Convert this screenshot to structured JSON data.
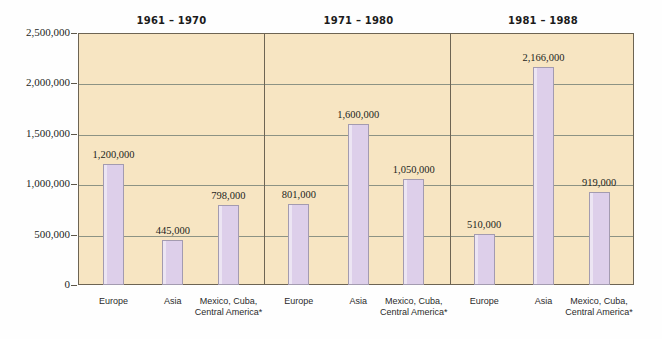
{
  "chart_data": {
    "type": "bar",
    "title": "",
    "subtitle": "",
    "xlabel": "",
    "ylabel": "",
    "ylim": [
      0,
      2500000
    ],
    "grid": true,
    "legend": "none",
    "y_ticks": [
      {
        "value": 0,
        "label": "0"
      },
      {
        "value": 500000,
        "label": "500,000"
      },
      {
        "value": 1000000,
        "label": "1,000,000"
      },
      {
        "value": 1500000,
        "label": "1,500,000"
      },
      {
        "value": 2000000,
        "label": "2,000,000"
      },
      {
        "value": 2500000,
        "label": "2,500,000"
      }
    ],
    "groups": [
      {
        "period": "1961 – 1970",
        "bars": [
          {
            "category": "Europe",
            "value": 1200000,
            "value_label": "1,200,000"
          },
          {
            "category": "Asia",
            "value": 445000,
            "value_label": "445,000"
          },
          {
            "category": "Mexico, Cuba,\nCentral America*",
            "value": 798000,
            "value_label": "798,000"
          }
        ]
      },
      {
        "period": "1971 – 1980",
        "bars": [
          {
            "category": "Europe",
            "value": 801000,
            "value_label": "801,000"
          },
          {
            "category": "Asia",
            "value": 1600000,
            "value_label": "1,600,000"
          },
          {
            "category": "Mexico, Cuba,\nCentral America*",
            "value": 1050000,
            "value_label": "1,050,000"
          }
        ]
      },
      {
        "period": "1981 – 1988",
        "bars": [
          {
            "category": "Europe",
            "value": 510000,
            "value_label": "510,000"
          },
          {
            "category": "Asia",
            "value": 2166000,
            "value_label": "2,166,000"
          },
          {
            "category": "Mexico, Cuba,\nCentral America*",
            "value": 919000,
            "value_label": "919,000"
          }
        ]
      }
    ],
    "categories": [
      "Europe",
      "Asia",
      "Mexico, Cuba, Central America*"
    ],
    "series": [
      {
        "name": "1961 – 1970",
        "values": [
          1200000,
          445000,
          798000
        ]
      },
      {
        "name": "1971 – 1980",
        "values": [
          801000,
          1600000,
          1050000
        ]
      },
      {
        "name": "1981 – 1988",
        "values": [
          510000,
          2166000,
          919000
        ]
      }
    ],
    "colors": {
      "bar_fill": "#ddcfea",
      "bar_border": "#a39bb0",
      "plot_background": "#f7e5c2",
      "plot_border": "#6d6453",
      "gridline": "#8d9384",
      "text": "#231f1c"
    }
  }
}
